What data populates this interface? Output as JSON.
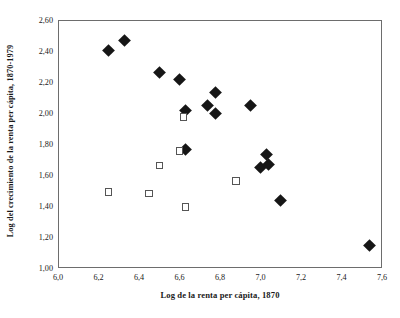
{
  "chart_data": {
    "type": "scatter",
    "title": "",
    "xlabel": "Log de la renta per cápita, 1870",
    "ylabel": "Log del crecimiento de la renta per cápita, 1870-1979",
    "xlim": [
      6.0,
      7.6
    ],
    "ylim": [
      1.0,
      2.6
    ],
    "xticks": [
      "6,0",
      "6,2",
      "6,4",
      "6,6",
      "6,8",
      "7,0",
      "7,2",
      "7,4",
      "7,6"
    ],
    "xtick_values": [
      6.0,
      6.2,
      6.4,
      6.6,
      6.8,
      7.0,
      7.2,
      7.4,
      7.6
    ],
    "yticks": [
      "1,00",
      "1,20",
      "1,40",
      "1,60",
      "1,80",
      "2,00",
      "2,20",
      "2,40",
      "2,60"
    ],
    "ytick_values": [
      1.0,
      1.2,
      1.4,
      1.6,
      1.8,
      2.0,
      2.2,
      2.4,
      2.6
    ],
    "grid": false,
    "legend": false,
    "legend_position": "none",
    "marker_colors": {
      "filled_diamond": "#161616",
      "open_square_edge": "#555555",
      "open_square_fill": "#ffffff"
    },
    "axis_color": "#6d6d6d",
    "background": "#ffffff",
    "series": [
      {
        "name": "filled-diamonds",
        "marker": "filled-diamond",
        "points": [
          {
            "x": 6.25,
            "y": 2.405
          },
          {
            "x": 6.33,
            "y": 2.465
          },
          {
            "x": 6.5,
            "y": 2.26
          },
          {
            "x": 6.6,
            "y": 2.215
          },
          {
            "x": 6.63,
            "y": 2.015
          },
          {
            "x": 6.74,
            "y": 2.05
          },
          {
            "x": 6.78,
            "y": 2.135
          },
          {
            "x": 6.78,
            "y": 1.995
          },
          {
            "x": 6.95,
            "y": 2.05
          },
          {
            "x": 6.63,
            "y": 1.765
          },
          {
            "x": 7.03,
            "y": 1.73
          },
          {
            "x": 7.0,
            "y": 1.65
          },
          {
            "x": 7.04,
            "y": 1.665
          },
          {
            "x": 7.1,
            "y": 1.435
          },
          {
            "x": 7.54,
            "y": 1.145
          }
        ]
      },
      {
        "name": "open-squares",
        "marker": "open-square",
        "points": [
          {
            "x": 6.62,
            "y": 1.975
          },
          {
            "x": 6.6,
            "y": 1.755
          },
          {
            "x": 6.5,
            "y": 1.66
          },
          {
            "x": 6.88,
            "y": 1.56
          },
          {
            "x": 6.25,
            "y": 1.49
          },
          {
            "x": 6.45,
            "y": 1.48
          },
          {
            "x": 6.63,
            "y": 1.395
          }
        ]
      }
    ]
  }
}
